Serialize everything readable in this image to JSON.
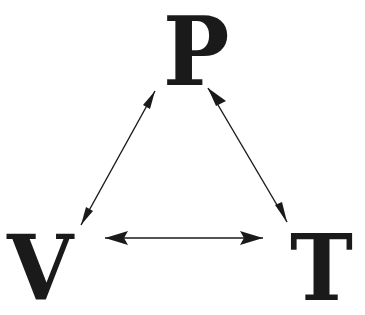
{
  "diagram": {
    "nodes": [
      {
        "id": "P",
        "label": "P",
        "position": "top"
      },
      {
        "id": "V",
        "label": "V",
        "position": "bottom-left"
      },
      {
        "id": "T",
        "label": "T",
        "position": "bottom-right"
      }
    ],
    "edges": [
      {
        "from": "P",
        "to": "V",
        "type": "bidirectional"
      },
      {
        "from": "P",
        "to": "T",
        "type": "bidirectional"
      },
      {
        "from": "V",
        "to": "T",
        "type": "bidirectional"
      }
    ],
    "colors": {
      "ink": "#1a1a1a",
      "background": "#ffffff"
    }
  }
}
